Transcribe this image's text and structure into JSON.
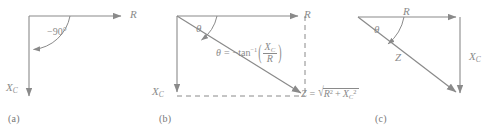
{
  "figure": {
    "background": "#ffffff",
    "stroke_color": "#8a8a8a",
    "text_color": "#8a8a8a",
    "caption_color": "#777777"
  },
  "panels": [
    {
      "caption": "(a)",
      "axis_r_label": "R",
      "axis_xc_label": "X",
      "axis_xc_sub": "C",
      "angle_label": "−90°"
    },
    {
      "caption": "(b)",
      "axis_r_label": "R",
      "axis_xc_label": "X",
      "axis_xc_sub": "C",
      "theta_label": "θ",
      "theta_equation": {
        "lhs": "θ",
        "eq": "=",
        "sign": "−",
        "fn": "tan",
        "exp": "−1",
        "num": "X",
        "num_sub": "C",
        "den": "R"
      },
      "z_equation": {
        "lhs": "Z",
        "eq": "=",
        "radical": "√",
        "term1": "R",
        "term1_exp": "2",
        "plus": "+",
        "term2": "X",
        "term2_sub": "C",
        "term2_exp": "2"
      }
    },
    {
      "caption": "(c)",
      "side_r_label": "R",
      "side_xc_label": "X",
      "side_xc_sub": "C",
      "hyp_label": "Z",
      "theta_label": "θ"
    }
  ]
}
